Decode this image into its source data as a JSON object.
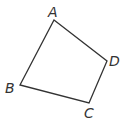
{
  "diagram": {
    "type": "quadrilateral",
    "stroke_color": "#333333",
    "vertices": [
      {
        "label": "A",
        "x": 54,
        "y": 20,
        "label_x": 48,
        "label_y": 17
      },
      {
        "label": "D",
        "x": 107,
        "y": 61,
        "label_x": 109,
        "label_y": 66
      },
      {
        "label": "C",
        "x": 89,
        "y": 103,
        "label_x": 84,
        "label_y": 118
      },
      {
        "label": "B",
        "x": 20,
        "y": 85,
        "label_x": 5,
        "label_y": 93
      }
    ],
    "edges": [
      [
        "A",
        "D"
      ],
      [
        "D",
        "C"
      ],
      [
        "C",
        "B"
      ],
      [
        "B",
        "A"
      ]
    ]
  }
}
